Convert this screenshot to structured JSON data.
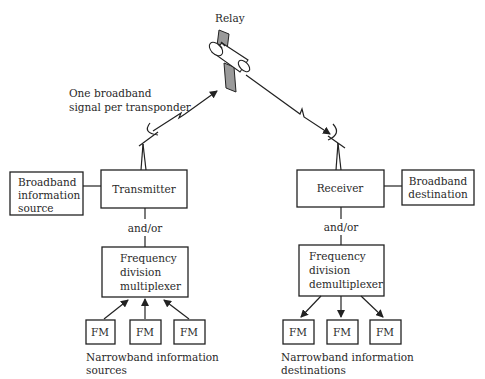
{
  "diagram": {
    "relay": {
      "label": "Relay"
    },
    "uplink_caption": {
      "line1": "One broadband",
      "line2": "signal per transponder"
    },
    "transmit_side": {
      "broadband_source": {
        "line1": "Broadband",
        "line2": "information",
        "line3": "source"
      },
      "transmitter": {
        "label": "Transmitter"
      },
      "and_or": "and/or",
      "multiplexer": {
        "line1": "Frequency",
        "line2": "division",
        "line3": "multiplexer"
      },
      "fm_boxes": [
        "FM",
        "FM",
        "FM"
      ],
      "caption": {
        "line1": "Narrowband information",
        "line2": "sources"
      }
    },
    "receive_side": {
      "receiver": {
        "label": "Receiver"
      },
      "broadband_destination": {
        "line1": "Broadband",
        "line2": "destination"
      },
      "and_or": "and/or",
      "demultiplexer": {
        "line1": "Frequency",
        "line2": "division",
        "line3": "demultiplexer"
      },
      "fm_boxes": [
        "FM",
        "FM",
        "FM"
      ],
      "caption": {
        "line1": "Narrowband information",
        "line2": "destinations"
      }
    },
    "colors": {
      "line": "#222222",
      "panel": "#9a9a9a",
      "background": "#ffffff"
    }
  }
}
